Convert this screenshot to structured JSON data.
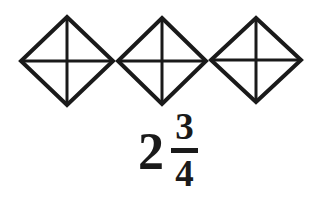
{
  "figure": {
    "background_color": "#ffffff",
    "stroke_color": "#1a1a1a",
    "text_color": "#1a1a1a"
  },
  "shapes": {
    "kind": "diamond",
    "count": 3,
    "parts_per_shape": 4,
    "divider_lines": "vertical-and-horizontal",
    "fill": "none",
    "items": [
      {
        "name": "diamond-1",
        "cx": 67,
        "cy": 61,
        "rx": 46,
        "ry": 44,
        "shaded_parts": 0
      },
      {
        "name": "diamond-2",
        "cx": 162,
        "cy": 61,
        "rx": 44,
        "ry": 43,
        "shaded_parts": 0
      },
      {
        "name": "diamond-3",
        "cx": 256,
        "cy": 60,
        "rx": 45,
        "ry": 42,
        "shaded_parts": 0
      }
    ]
  },
  "label": {
    "whole": "2",
    "numerator": "3",
    "denominator": "4",
    "full_text": "2 3/4"
  }
}
